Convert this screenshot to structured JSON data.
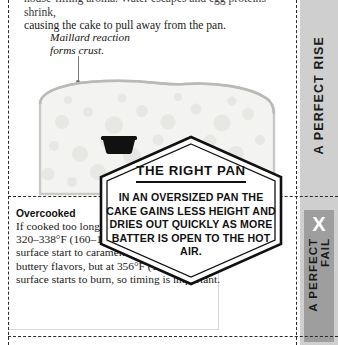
{
  "page": {
    "top_paragraph_line1": "house-filling aroma. Water escapes and egg proteins shrink,",
    "top_paragraph_line2": "causing the cake to pull away from the pan.",
    "annotation_maillard_line1": "Maillard reaction",
    "annotation_maillard_line2": "forms crust."
  },
  "overcooked": {
    "title": "Overcooked",
    "body": "If cooked too long, the cake will dry. At 320–338°F (160–170°C) sugars on the surface start to caramelize, adding nutty, buttery flavors, but at 356°F (180°C), the surface starts to burn, so timing is important."
  },
  "callout": {
    "icon": "frying-pan-icon",
    "title": "THE RIGHT PAN",
    "body": "IN AN OVERSIZED PAN THE CAKE GAINS LESS HEIGHT AND DRIES OUT QUICKLY AS MORE BATTER IS OPEN TO THE HOT AIR."
  },
  "tabs": {
    "rise_label": "A PERFECT RISE",
    "fail_mark": "X",
    "fail_label_line1": "A PERFECT",
    "fail_label_line2": "FAIL"
  },
  "colors": {
    "tab_background": "#cfcfcf",
    "fail_panel": "#9e9e9e",
    "ink": "#111111",
    "cake_fill": "#f2f2f0",
    "cake_outline": "#c9c9c6"
  }
}
